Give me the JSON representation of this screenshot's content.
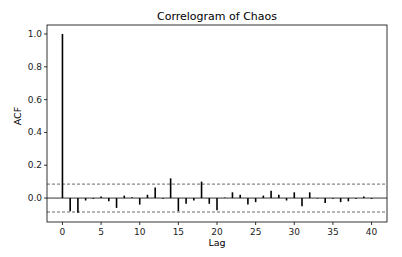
{
  "chart_data": {
    "type": "bar",
    "subtype": "stem",
    "title": "Correlogram of Chaos",
    "xlabel": "Lag",
    "ylabel": "ACF",
    "xlim": [
      -2,
      42
    ],
    "ylim": [
      -0.146,
      1.055
    ],
    "xticks": [
      0,
      5,
      10,
      15,
      20,
      25,
      30,
      35,
      40
    ],
    "yticks": [
      0.0,
      0.2,
      0.4,
      0.6,
      0.8,
      1.0
    ],
    "ytick_labels": [
      "0.0",
      "0.2",
      "0.4",
      "0.6",
      "0.8",
      "1.0"
    ],
    "grid": false,
    "confidence_band": {
      "upper": 0.085,
      "lower": -0.085,
      "style": "dashed"
    },
    "x": [
      0,
      1,
      2,
      3,
      4,
      5,
      6,
      7,
      8,
      9,
      10,
      11,
      12,
      13,
      14,
      15,
      16,
      17,
      18,
      19,
      20,
      21,
      22,
      23,
      24,
      25,
      26,
      27,
      28,
      29,
      30,
      31,
      32,
      33,
      34,
      35,
      36,
      37,
      38,
      39,
      40
    ],
    "values": [
      1.0,
      -0.08,
      -0.09,
      -0.015,
      -0.005,
      0.01,
      -0.02,
      -0.06,
      0.015,
      0.005,
      -0.04,
      0.02,
      0.065,
      -0.005,
      0.12,
      -0.08,
      -0.035,
      -0.015,
      0.1,
      -0.035,
      -0.075,
      0.003,
      0.035,
      0.02,
      -0.04,
      -0.025,
      0.015,
      0.045,
      0.02,
      -0.015,
      0.035,
      -0.05,
      0.035,
      -0.003,
      -0.03,
      -0.005,
      -0.025,
      -0.02,
      -0.005,
      0.01,
      -0.005
    ],
    "colors": {
      "stem": "#000000",
      "band": "#444444",
      "frame": "#000000"
    }
  }
}
